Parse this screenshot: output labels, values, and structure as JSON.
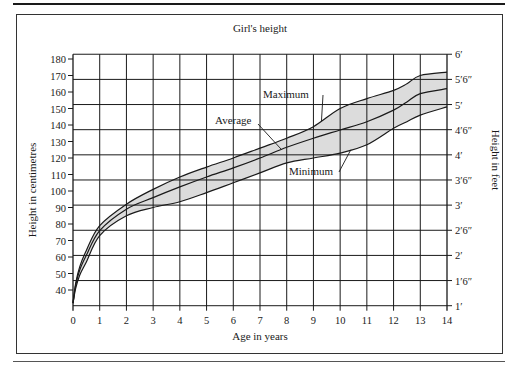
{
  "chart_data": {
    "type": "area",
    "title": "Girl's height",
    "xlabel": "Age in years",
    "ylabel": "Height in centimetres",
    "ylabel_right": "Height in feet",
    "xlim": [
      0,
      14
    ],
    "ylim": [
      30.48,
      182.88
    ],
    "x_ticks": [
      0,
      1,
      2,
      3,
      4,
      5,
      6,
      7,
      8,
      9,
      10,
      11,
      12,
      13,
      14
    ],
    "x_tick_labels": [
      "0",
      "1",
      "2",
      "3",
      "4",
      "5",
      "6",
      "7",
      "8",
      "9",
      "10",
      "11",
      "12",
      "13",
      "14"
    ],
    "y_ticks_cm": [
      40,
      50,
      60,
      70,
      80,
      90,
      100,
      110,
      120,
      130,
      140,
      150,
      160,
      170,
      180
    ],
    "y_tick_labels_cm": [
      "40",
      "50",
      "60",
      "70",
      "80",
      "90",
      "100",
      "110",
      "120",
      "130",
      "140",
      "150",
      "160",
      "170",
      "180"
    ],
    "y_ticks_feet_cm": [
      30.48,
      45.72,
      60.96,
      76.2,
      91.44,
      106.68,
      121.92,
      137.16,
      152.4,
      167.64,
      182.88
    ],
    "y_tick_labels_feet": [
      "1′",
      "1′6″",
      "2′",
      "2′6″",
      "3′",
      "3′6″",
      "4′",
      "4′6″",
      "5′",
      "5′6″",
      "6′"
    ],
    "grid": true,
    "band_fill": "#dcdcdc",
    "x": [
      0,
      0.1,
      0.25,
      0.5,
      1,
      2,
      3,
      4,
      5,
      6,
      7,
      8,
      9,
      10,
      11,
      12,
      12.5,
      13,
      14
    ],
    "series": [
      {
        "name": "Maximum",
        "values": [
          32,
          44,
          54,
          64,
          79,
          92,
          101,
          108.5,
          114.5,
          120,
          126,
          132,
          139,
          150,
          156,
          161,
          165,
          170,
          172
        ]
      },
      {
        "name": "Average",
        "values": [
          32,
          43,
          52,
          61,
          76,
          89,
          96,
          102.5,
          108.5,
          114,
          120,
          126.5,
          132,
          137,
          142,
          149,
          154,
          159,
          162
        ]
      },
      {
        "name": "Minimum",
        "values": [
          32,
          41,
          49,
          57,
          73,
          85,
          90,
          93.5,
          99,
          105,
          111,
          117,
          120,
          123,
          128,
          138,
          142,
          146,
          151
        ]
      }
    ],
    "annotations": [
      {
        "text": "Maximum",
        "points_to_series": "Maximum",
        "at_age": 9.3
      },
      {
        "text": "Average",
        "points_to_series": "Average",
        "at_age": 7.8
      },
      {
        "text": "Minimum",
        "points_to_series": "Minimum",
        "at_age": 10.4
      }
    ]
  }
}
